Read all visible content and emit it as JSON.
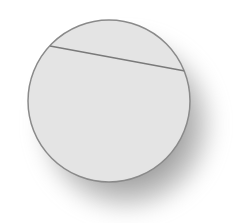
{
  "image": {
    "subject": "circle-with-chord",
    "background_color": "#ffffff",
    "disc": {
      "center": [
        109,
        101
      ],
      "radius": 81,
      "fill_color": "#e4e4e4",
      "outline_color": "#8a8a8a"
    },
    "chord": {
      "from": [
        50,
        46
      ],
      "to": [
        185,
        71
      ],
      "color": "#7a7a7a"
    },
    "shadow_color": "#5a5a5a"
  }
}
